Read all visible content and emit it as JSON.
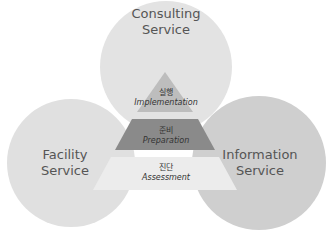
{
  "diagram": {
    "circles": [
      {
        "id": "consulting",
        "line1": "Consulting",
        "line2": "Service",
        "color": "#e3e3e3"
      },
      {
        "id": "facility",
        "line1": "Facility",
        "line2": "Service",
        "color": "#e0e0e0"
      },
      {
        "id": "information",
        "line1": "Information",
        "line2": "Service",
        "color": "#cfcfcf"
      }
    ],
    "pyramid": [
      {
        "level": "top",
        "korean": "실행",
        "english": "Implementation",
        "color": "#bdbdbd"
      },
      {
        "level": "middle",
        "korean": "준비",
        "english": "Preparation",
        "color": "#8a8a8a"
      },
      {
        "level": "bottom",
        "korean": "진단",
        "english": "Assessment",
        "color": "#ececec"
      }
    ]
  }
}
